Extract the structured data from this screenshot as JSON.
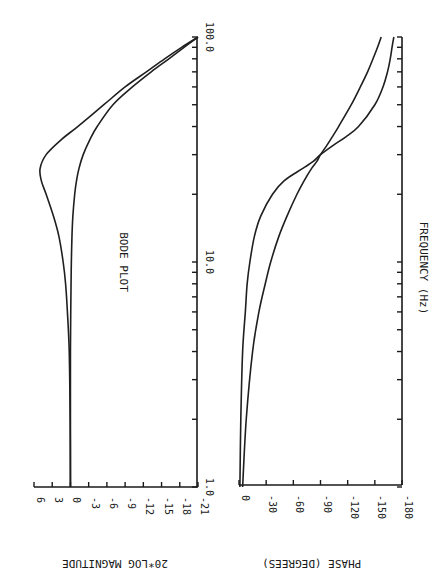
{
  "chart_data": [
    {
      "type": "line",
      "title": "BODE PLOT",
      "xlabel": "FREQUENCY (Hz)",
      "ylabel": "20*LOG MAGNITUDE",
      "xscale": "log",
      "xlim": [
        1.0,
        100.0
      ],
      "ylim": [
        -21,
        6
      ],
      "xtick_labels": [
        "1.0",
        "10.0",
        "100.0"
      ],
      "ytick_labels": [
        "6",
        "3",
        "0",
        "-3",
        "-6",
        "-9",
        "-12",
        "-15",
        "-18",
        "-21"
      ],
      "yticks": [
        6,
        3,
        0,
        -3,
        -6,
        -9,
        -12,
        -15,
        -18,
        -21
      ],
      "grid": false,
      "orientation": "rotated 90 degrees clockwise",
      "series": [
        {
          "name": "underdamped (resonant peak)",
          "x": [
            1,
            2,
            4,
            6,
            8,
            10,
            13,
            16,
            20,
            23,
            26,
            30,
            35,
            40,
            50,
            60,
            70,
            80,
            90,
            100
          ],
          "values": [
            0,
            0.05,
            0.2,
            0.5,
            0.8,
            1.2,
            1.9,
            2.8,
            4.0,
            4.8,
            5.0,
            4.0,
            1.5,
            -1.2,
            -5.5,
            -9.0,
            -12.5,
            -15.5,
            -18.3,
            -21.0
          ]
        },
        {
          "name": "well-damped",
          "x": [
            1,
            2,
            4,
            6,
            8,
            10,
            13,
            16,
            20,
            23,
            26,
            30,
            35,
            40,
            50,
            60,
            70,
            80,
            90,
            100
          ],
          "values": [
            0,
            0,
            0,
            -0.05,
            -0.1,
            -0.15,
            -0.25,
            -0.4,
            -0.7,
            -1.0,
            -1.4,
            -2.1,
            -3.2,
            -4.4,
            -7.0,
            -10.2,
            -13.3,
            -16.2,
            -18.7,
            -21.0
          ]
        }
      ]
    },
    {
      "type": "line",
      "title": "",
      "xlabel": "FREQUENCY (Hz)",
      "ylabel": "PHASE (DEGREES)",
      "xscale": "log",
      "xlim": [
        1.0,
        100.0
      ],
      "ylim": [
        -180,
        0
      ],
      "ytick_labels": [
        "0",
        "-30",
        "-60",
        "-90",
        "-120",
        "-150",
        "-180"
      ],
      "yticks": [
        0,
        -30,
        -60,
        -90,
        -120,
        -150,
        -180
      ],
      "grid": false,
      "orientation": "rotated 90 degrees clockwise",
      "series": [
        {
          "name": "underdamped (sharp transition)",
          "x": [
            1,
            2,
            4,
            6,
            8,
            10,
            13,
            16,
            20,
            23,
            26,
            28,
            30,
            33,
            36,
            40,
            50,
            60,
            70,
            80,
            90,
            100
          ],
          "values": [
            -1,
            -2,
            -4,
            -7,
            -9,
            -12,
            -17,
            -24,
            -37,
            -50,
            -70,
            -82,
            -90,
            -104,
            -118,
            -132,
            -150,
            -159,
            -164,
            -167,
            -169,
            -171
          ]
        },
        {
          "name": "well-damped (gradual transition)",
          "x": [
            1,
            2,
            4,
            6,
            8,
            10,
            13,
            16,
            20,
            23,
            26,
            28,
            30,
            33,
            36,
            40,
            50,
            60,
            70,
            80,
            90,
            100
          ],
          "values": [
            -4,
            -8,
            -15,
            -22,
            -29,
            -35,
            -44,
            -53,
            -64,
            -72,
            -80,
            -86,
            -90,
            -97,
            -103,
            -110,
            -124,
            -134,
            -142,
            -148,
            -153,
            -157
          ]
        }
      ]
    }
  ],
  "labels": {
    "title": "BODE PLOT",
    "freq_axis": "FREQUENCY  (Hz)",
    "mag_axis": "20*LOG MAGNITUDE",
    "phase_axis": "PHASE  (DEGREES)",
    "freq_ticks": [
      "1.0",
      "10.0",
      "100.0"
    ]
  }
}
